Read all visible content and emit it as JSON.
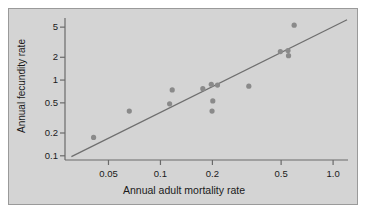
{
  "chart_data": {
    "type": "scatter",
    "title": "",
    "xlabel": "Annual adult mortality rate",
    "ylabel": "Annual fecundity rate",
    "xscale": "log",
    "yscale": "log",
    "xlim": [
      0.028,
      1.22
    ],
    "ylim": [
      0.088,
      6.6
    ],
    "grid": false,
    "legend": null,
    "xticks": [
      0.05,
      0.1,
      0.2,
      0.5,
      1.0
    ],
    "xticklabels": [
      "0.05",
      "0.1",
      "0.2",
      "0.5",
      "1.0"
    ],
    "yticks": [
      0.1,
      0.2,
      0.5,
      1,
      2,
      5
    ],
    "yticklabels": [
      "0.1",
      "0.2",
      "0.5",
      "1",
      "2",
      "5"
    ],
    "marker": {
      "shape": "circle",
      "color": "#8a8a8a",
      "size_px": 5.2
    },
    "points": [
      {
        "x": 0.041,
        "y": 0.175
      },
      {
        "x": 0.066,
        "y": 0.39
      },
      {
        "x": 0.113,
        "y": 0.485
      },
      {
        "x": 0.117,
        "y": 0.74
      },
      {
        "x": 0.176,
        "y": 0.77
      },
      {
        "x": 0.197,
        "y": 0.88
      },
      {
        "x": 0.199,
        "y": 0.39
      },
      {
        "x": 0.201,
        "y": 0.53
      },
      {
        "x": 0.214,
        "y": 0.86
      },
      {
        "x": 0.325,
        "y": 0.83
      },
      {
        "x": 0.495,
        "y": 2.38
      },
      {
        "x": 0.548,
        "y": 2.45
      },
      {
        "x": 0.552,
        "y": 2.1
      },
      {
        "x": 0.595,
        "y": 5.3
      }
    ],
    "fit_line": {
      "type": "linear-on-log-axes",
      "color": "#6f6f6f",
      "x_start": 0.0305,
      "y_start": 0.0975,
      "x_end": 1.205,
      "y_end": 6.25
    },
    "plot_background": "#d4d4d4",
    "axis_color": "#6a6a6a",
    "text_color": "#1a1a1a"
  }
}
